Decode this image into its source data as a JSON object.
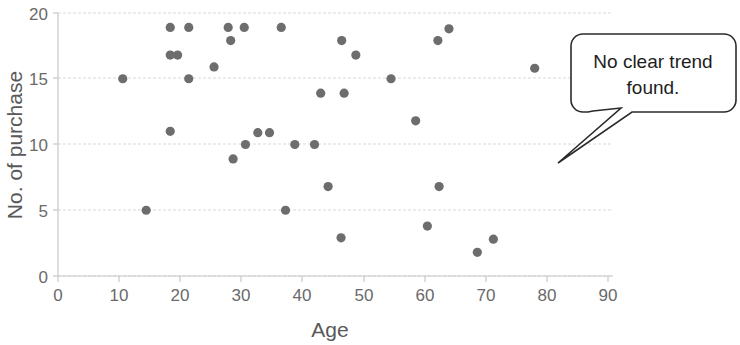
{
  "chart_data": {
    "type": "scatter",
    "title": "",
    "xlabel": "Age",
    "ylabel": "No. of purchase",
    "xlim": [
      0,
      90
    ],
    "ylim": [
      0,
      20
    ],
    "xticks": [
      0,
      10,
      20,
      30,
      40,
      50,
      60,
      70,
      80,
      90
    ],
    "yticks": [
      0,
      5,
      10,
      15,
      20
    ],
    "grid": true,
    "legend": "none",
    "marker_color": "#6d6d6d",
    "series": [
      {
        "name": "purchases",
        "points": [
          [
            10.5,
            15.0
          ],
          [
            14.3,
            5.0
          ],
          [
            18.2,
            18.9
          ],
          [
            18.2,
            16.8
          ],
          [
            19.4,
            16.8
          ],
          [
            18.2,
            11.0
          ],
          [
            21.2,
            18.9
          ],
          [
            21.2,
            15.0
          ],
          [
            25.3,
            15.9
          ],
          [
            27.6,
            18.9
          ],
          [
            28.0,
            17.9
          ],
          [
            28.4,
            8.9
          ],
          [
            30.2,
            18.9
          ],
          [
            30.4,
            10.0
          ],
          [
            32.4,
            10.9
          ],
          [
            34.3,
            10.9
          ],
          [
            36.2,
            18.9
          ],
          [
            36.9,
            5.0
          ],
          [
            38.4,
            10.0
          ],
          [
            41.6,
            10.0
          ],
          [
            43.8,
            6.8
          ],
          [
            42.6,
            13.9
          ],
          [
            45.9,
            2.9
          ],
          [
            46.4,
            13.9
          ],
          [
            46.0,
            17.9
          ],
          [
            48.3,
            16.8
          ],
          [
            54.0,
            15.0
          ],
          [
            58.0,
            11.8
          ],
          [
            59.9,
            3.8
          ],
          [
            61.8,
            6.8
          ],
          [
            61.6,
            17.9
          ],
          [
            63.4,
            18.8
          ],
          [
            68.0,
            1.8
          ],
          [
            70.6,
            2.8
          ],
          [
            77.3,
            15.8
          ]
        ]
      }
    ],
    "annotations": [
      {
        "name": "no-trend-callout",
        "text_line1": "No clear trend",
        "text_line2": "found."
      }
    ]
  }
}
